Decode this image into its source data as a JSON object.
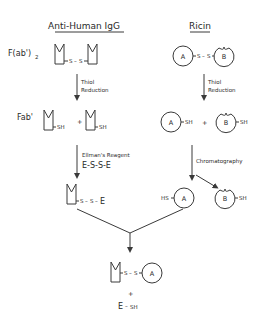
{
  "diagram": {
    "columns": {
      "left": {
        "title": "Anti-Human IgG"
      },
      "right": {
        "title": "Ricin"
      }
    },
    "labels": {
      "fab2": "F(ab')",
      "fab2_sub": "2",
      "fab": "Fab'",
      "A": "A",
      "B": "B",
      "S": "S",
      "SH": "SH",
      "HS": "HS",
      "E": "E",
      "plus": "+",
      "dash": "–"
    },
    "steps": {
      "left_step1": [
        "Thiol",
        "Reduction"
      ],
      "right_step1": [
        "Thiol",
        "Reduction"
      ],
      "left_step2_line1": "Ellman's Reagent",
      "left_step2_line2": "E-S-S-E",
      "right_step2": "Chromatography"
    },
    "products": {
      "final_conjugate": "Fab'-S-S-A",
      "byproduct": "E-SH"
    }
  }
}
